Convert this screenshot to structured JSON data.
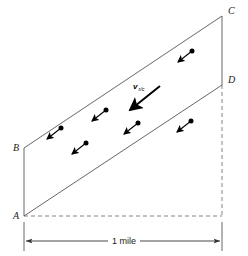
{
  "figure": {
    "background_color": "#ffffff",
    "stroke_color": "#555555",
    "arrow_color": "#000000",
    "label_color": "#1a1a1a",
    "vertices": [
      {
        "id": "A",
        "label": "A",
        "x": 24,
        "y": 216,
        "label_x": 13,
        "label_y": 219
      },
      {
        "id": "B",
        "label": "B",
        "x": 24,
        "y": 148,
        "label_x": 13,
        "label_y": 151
      },
      {
        "id": "C",
        "label": "C",
        "x": 222,
        "y": 16,
        "label_x": 228,
        "label_y": 14
      },
      {
        "id": "D",
        "label": "D",
        "x": 222,
        "y": 85,
        "label_x": 228,
        "label_y": 83
      }
    ],
    "bank_lines": [
      {
        "name": "upper-bank-B-to-C",
        "x1": 24,
        "y1": 148,
        "x2": 222,
        "y2": 16
      },
      {
        "name": "lower-bank-A-to-D",
        "x1": 24,
        "y1": 216,
        "x2": 222,
        "y2": 85
      },
      {
        "name": "left-edge-A-to-B",
        "x1": 24,
        "y1": 216,
        "x2": 24,
        "y2": 148
      },
      {
        "name": "right-edge-C-to-D",
        "x1": 222,
        "y1": 16,
        "x2": 222,
        "y2": 85
      }
    ],
    "dashed_lines": [
      {
        "name": "horizontal-baseline-from-A",
        "x1": 24,
        "y1": 216,
        "x2": 222,
        "y2": 216
      },
      {
        "name": "vertical-drop-from-D",
        "x1": 222,
        "y1": 85,
        "x2": 222,
        "y2": 216
      }
    ],
    "dimension": {
      "label": "1 mile",
      "label_x": 124,
      "label_y": 244,
      "y": 241,
      "x_start": 24,
      "x_end": 222,
      "extension_left": {
        "x": 24,
        "y1": 222,
        "y2": 250
      },
      "extension_right": {
        "x": 222,
        "y1": 222,
        "y2": 250
      }
    },
    "main_vector": {
      "label_main": "v",
      "label_sub": "r/c",
      "label_x": 133,
      "label_y": 89,
      "tail_x": 160,
      "tail_y": 86,
      "tip_x": 130,
      "tip_y": 110
    },
    "current_arrows": [
      {
        "name": "current-arrow-1",
        "dot_x": 61,
        "dot_y": 128,
        "tip_x": 47,
        "tip_y": 139
      },
      {
        "name": "current-arrow-2",
        "dot_x": 86,
        "dot_y": 143,
        "tip_x": 72,
        "tip_y": 154
      },
      {
        "name": "current-arrow-3",
        "dot_x": 106,
        "dot_y": 110,
        "tip_x": 92,
        "tip_y": 121
      },
      {
        "name": "current-arrow-4",
        "dot_x": 138,
        "dot_y": 123,
        "tip_x": 124,
        "tip_y": 134
      },
      {
        "name": "current-arrow-5",
        "dot_x": 191,
        "dot_y": 121,
        "tip_x": 177,
        "tip_y": 132
      },
      {
        "name": "current-arrow-6",
        "dot_x": 192,
        "dot_y": 51,
        "tip_x": 178,
        "tip_y": 62
      }
    ]
  }
}
